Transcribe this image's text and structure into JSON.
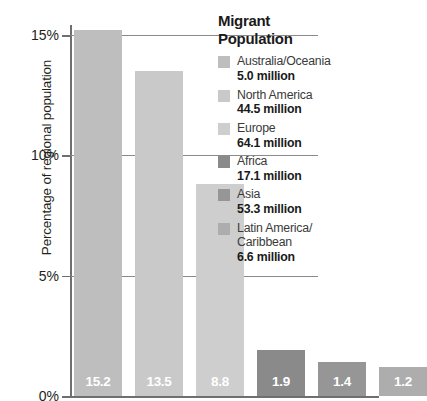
{
  "chart_data": {
    "type": "bar",
    "title": "",
    "xlabel": "",
    "ylabel": "Percentage of regional population",
    "ylim": [
      0,
      15
    ],
    "yticks": [
      "0%",
      "5%",
      "10%",
      "15%"
    ],
    "ytick_values": [
      0,
      5,
      10,
      15
    ],
    "grid": true,
    "legend_position": "right",
    "categories": [
      "Australia/Oceania",
      "North America",
      "Europe",
      "Africa",
      "Asia",
      "Latin America/Caribbean"
    ],
    "values": [
      15.2,
      13.5,
      8.8,
      1.9,
      1.4,
      1.2
    ],
    "value_labels": [
      "15.2",
      "13.5",
      "8.8",
      "1.9",
      "1.4",
      "1.2"
    ],
    "bar_colors": [
      "#bebebe",
      "#c9c9c9",
      "#cecece",
      "#8a8a8a",
      "#969696",
      "#adadad"
    ],
    "migrant_population_millions": [
      5.0,
      44.5,
      64.1,
      17.1,
      53.3,
      6.6
    ]
  },
  "axis": {
    "y_title": "Percentage of regional population",
    "ticks": [
      {
        "label": "15%",
        "value": 15
      },
      {
        "label": "10%",
        "value": 10
      },
      {
        "label": "5%",
        "value": 5
      },
      {
        "label": "0%",
        "value": 0
      }
    ]
  },
  "bars": [
    {
      "name": "australia-oceania",
      "label": "15.2"
    },
    {
      "name": "north-america",
      "label": "13.5"
    },
    {
      "name": "europe",
      "label": "8.8"
    },
    {
      "name": "africa",
      "label": "1.9"
    },
    {
      "name": "asia",
      "label": "1.4"
    },
    {
      "name": "latin-america-caribbean",
      "label": "1.2"
    }
  ],
  "legend": {
    "title_line1": "Migrant",
    "title_line2": "Population",
    "items": [
      {
        "region": "Australia/Oceania",
        "region2": "",
        "amount": "5.0 million",
        "color": "#bebebe"
      },
      {
        "region": "North America",
        "region2": "",
        "amount": "44.5 million",
        "color": "#c9c9c9"
      },
      {
        "region": "Europe",
        "region2": "",
        "amount": "64.1 million",
        "color": "#cecece"
      },
      {
        "region": "Africa",
        "region2": "",
        "amount": "17.1 million",
        "color": "#8a8a8a"
      },
      {
        "region": "Asia",
        "region2": "",
        "amount": "53.3 million",
        "color": "#969696"
      },
      {
        "region": "Latin America/",
        "region2": "Caribbean",
        "amount": "6.6 million",
        "color": "#adadad"
      }
    ]
  }
}
